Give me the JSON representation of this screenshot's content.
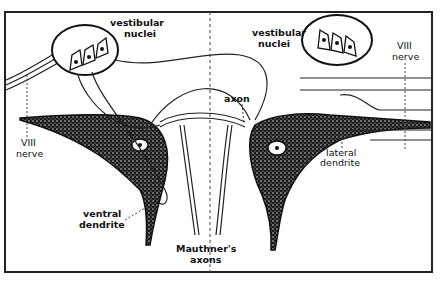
{
  "diagram": {
    "labels": {
      "vestibular_nuclei_left": [
        "vestibular",
        "nuclei"
      ],
      "vestibular_nuclei_right": [
        "vestibular",
        "nuclei"
      ],
      "viii_nerve_left": [
        "VIII",
        "nerve"
      ],
      "viii_nerve_right": [
        "VIII",
        "nerve"
      ],
      "axon": "axon",
      "lateral_dendrite": [
        "lateral",
        "dendrite"
      ],
      "ventral_dendrite": [
        "ventral",
        "dendrite"
      ],
      "mauthners_axons": [
        "Mauthner's",
        "axons"
      ]
    },
    "colors": {
      "ink": "#111111",
      "background": "#ffffff",
      "frame": "#222222"
    }
  }
}
